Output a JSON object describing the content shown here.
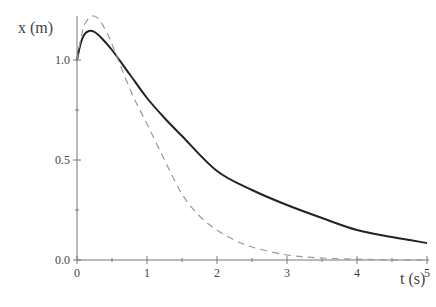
{
  "chart_data": {
    "type": "line",
    "title": "",
    "xlabel": "t (s)",
    "ylabel": "x (m)",
    "xlim": [
      0,
      5
    ],
    "ylim": [
      0,
      1.25
    ],
    "grid": false,
    "legend": null,
    "x_ticks": [
      {
        "value": 0,
        "label": "0"
      },
      {
        "value": 1,
        "label": "1"
      },
      {
        "value": 2,
        "label": "2"
      },
      {
        "value": 3,
        "label": "3"
      },
      {
        "value": 4,
        "label": "4"
      },
      {
        "value": 5,
        "label": "5"
      }
    ],
    "x_minor_ticks": [
      0.5,
      1.5,
      2.5,
      3.5,
      4.5
    ],
    "y_ticks": [
      {
        "value": 0.0,
        "label": "0.0"
      },
      {
        "value": 0.5,
        "label": "0.5"
      },
      {
        "value": 1.0,
        "label": "1.0"
      }
    ],
    "y_minor_ticks": [
      0.25,
      0.75
    ],
    "series": [
      {
        "name": "solid",
        "style": "solid",
        "color": "#222222",
        "x": [
          0,
          0.05,
          0.1,
          0.17,
          0.25,
          0.35,
          0.5,
          0.75,
          1.0,
          1.25,
          1.5,
          2.0,
          2.5,
          3.0,
          3.5,
          4.0,
          4.5,
          5.0
        ],
        "y": [
          1.0,
          1.08,
          1.125,
          1.145,
          1.14,
          1.11,
          1.05,
          0.93,
          0.81,
          0.71,
          0.62,
          0.445,
          0.35,
          0.275,
          0.21,
          0.15,
          0.115,
          0.085
        ]
      },
      {
        "name": "dashed",
        "style": "dashed",
        "color": "#999999",
        "x": [
          0,
          0.05,
          0.1,
          0.17,
          0.24,
          0.32,
          0.45,
          0.6,
          0.8,
          1.0,
          1.25,
          1.5,
          1.75,
          2.0,
          2.25,
          2.5,
          3.0,
          3.5,
          4.0,
          4.5,
          5.0
        ],
        "y": [
          1.0,
          1.1,
          1.17,
          1.21,
          1.22,
          1.2,
          1.12,
          0.99,
          0.82,
          0.68,
          0.5,
          0.33,
          0.22,
          0.15,
          0.1,
          0.065,
          0.025,
          0.01,
          0.004,
          0.001,
          0.0
        ]
      }
    ]
  }
}
